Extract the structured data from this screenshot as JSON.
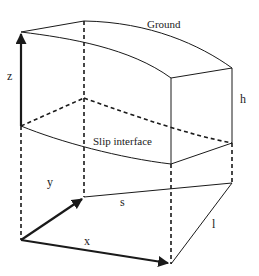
{
  "diagram": {
    "type": "3d-block-schematic",
    "labels": {
      "ground": "Ground",
      "slip_interface": "Slip interface",
      "z_axis": "z",
      "y_axis": "y",
      "x_axis": "x",
      "height": "h",
      "length": "l",
      "surface": "s"
    },
    "colors": {
      "line": "#1a1a1a",
      "background": "#ffffff"
    }
  }
}
